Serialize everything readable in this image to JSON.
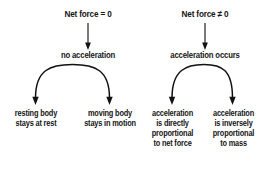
{
  "diagram": {
    "title_left": "Net force = 0",
    "title_right": "Net force ≠ 0",
    "branches": [
      {
        "id": "zero-net-force",
        "root_label": "Net force = 0",
        "mid_label": "no acceleration",
        "leaves": [
          {
            "id": "resting-body",
            "lines": "resting body\nstays at rest"
          },
          {
            "id": "moving-body",
            "lines": "moving body\nstays in motion"
          }
        ]
      },
      {
        "id": "nonzero-net-force",
        "root_label": "Net force ≠ 0",
        "mid_label": "acceleration occurs",
        "leaves": [
          {
            "id": "directly-proportional",
            "lines": "acceleration\nis directly\nproportional\nto net force"
          },
          {
            "id": "inversely-proportional",
            "lines": "acceleration\nis inversely\nproportional\nto mass"
          }
        ]
      }
    ],
    "colors": {
      "background": "#ffffff",
      "text": "#151515",
      "connector": "#121212"
    }
  }
}
